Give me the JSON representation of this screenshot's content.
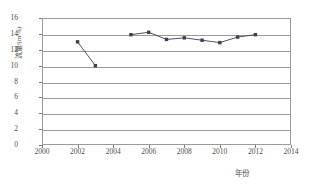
{
  "chart_data": {
    "type": "line",
    "title": "",
    "xlabel": "年份",
    "ylabel": "流量/(m³/s)",
    "xlim": [
      2000,
      2014
    ],
    "ylim": [
      0,
      16
    ],
    "xticks": [
      2000,
      2002,
      2004,
      2006,
      2008,
      2010,
      2012,
      2014
    ],
    "yticks": [
      0,
      2,
      4,
      6,
      8,
      10,
      12,
      14,
      16
    ],
    "grid": true,
    "legend": "none",
    "marker": "square",
    "series": [
      {
        "name": "流量",
        "color": "#3d3d54",
        "x": [
          2002,
          2003,
          2005,
          2006,
          2007,
          2008,
          2009,
          2010,
          2011,
          2012
        ],
        "values": [
          13.0,
          10.0,
          13.9,
          14.2,
          13.3,
          13.5,
          13.2,
          12.9,
          13.6,
          13.9
        ],
        "segments": [
          {
            "x": [
              2002,
              2003
            ],
            "values": [
              13.0,
              10.0
            ]
          },
          {
            "x": [
              2005,
              2006,
              2007,
              2008,
              2009,
              2010,
              2011,
              2012
            ],
            "values": [
              13.9,
              14.2,
              13.3,
              13.5,
              13.2,
              12.9,
              13.6,
              13.9
            ]
          }
        ]
      }
    ]
  },
  "axes": {
    "x_tick_labels": [
      "2000",
      "2002",
      "2004",
      "2006",
      "2008",
      "2010",
      "2012",
      "2014"
    ],
    "y_tick_labels": [
      "0",
      "2",
      "4",
      "6",
      "8",
      "10",
      "12",
      "14",
      "16"
    ],
    "x_axis_title": "年份",
    "y_axis_title": "流量/(m³/s)"
  },
  "style": {
    "grid_color": "#9a9a9a",
    "axis_color": "#9a9a9a",
    "text_color": "#4d4d4d",
    "series_color": "#3d3d54",
    "background": "#ffffff"
  }
}
